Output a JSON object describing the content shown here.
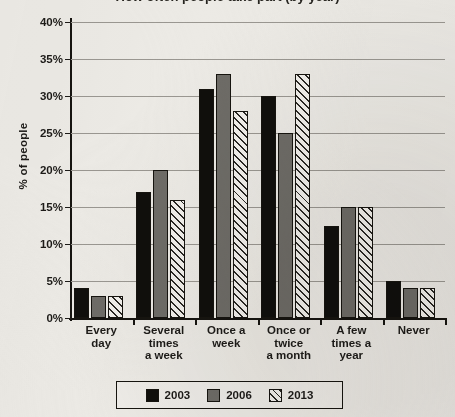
{
  "chart_data": {
    "type": "bar",
    "title": "How often people take part (by year)",
    "xlabel": "",
    "ylabel": "% of people",
    "ylim": [
      0,
      40
    ],
    "ytick_step": 5,
    "ytick_labels": [
      "0%",
      "5%",
      "10%",
      "15%",
      "20%",
      "25%",
      "30%",
      "35%",
      "40%"
    ],
    "grid": true,
    "legend_position": "bottom",
    "categories": [
      "Every day",
      "Several times a week",
      "Once a week",
      "Once or twice a month",
      "A few times a year",
      "Never"
    ],
    "category_lines": [
      [
        "Every",
        "day"
      ],
      [
        "Several",
        "times",
        "a week"
      ],
      [
        "Once a",
        "week"
      ],
      [
        "Once or",
        "twice",
        "a month"
      ],
      [
        "A few",
        "times a",
        "year"
      ],
      [
        "Never"
      ]
    ],
    "series": [
      {
        "name": "2003",
        "color": "#100f0c",
        "fill": "solid-black",
        "values": [
          4,
          17,
          31,
          30,
          12.5,
          5
        ]
      },
      {
        "name": "2006",
        "color": "#6e6c67",
        "fill": "solid-gray",
        "values": [
          3,
          20,
          33,
          25,
          15,
          4
        ]
      },
      {
        "name": "2013",
        "color": "#f2f0ec",
        "fill": "diagonal-hatch",
        "values": [
          3,
          16,
          28,
          33,
          15,
          4
        ]
      }
    ]
  },
  "legend": {
    "items": [
      {
        "label": "2003"
      },
      {
        "label": "2006"
      },
      {
        "label": "2013"
      }
    ]
  }
}
